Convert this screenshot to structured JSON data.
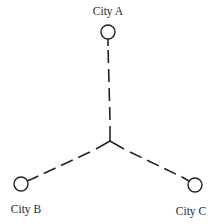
{
  "diagram": {
    "type": "network",
    "junction": {
      "x": 110,
      "y": 141
    },
    "cities": [
      {
        "id": "A",
        "label": "City A",
        "x": 108,
        "y": 32,
        "label_x": 108,
        "label_y": 14
      },
      {
        "id": "B",
        "label": "City B",
        "x": 21,
        "y": 184,
        "label_x": 26,
        "label_y": 212
      },
      {
        "id": "C",
        "label": "City C",
        "x": 195,
        "y": 185,
        "label_x": 191,
        "label_y": 214
      }
    ],
    "edges": [
      {
        "from": "junction",
        "to": "A",
        "style": "dashed"
      },
      {
        "from": "junction",
        "to": "B",
        "style": "dashed"
      },
      {
        "from": "junction",
        "to": "C",
        "style": "dashed"
      }
    ],
    "colors": {
      "line": "#222222",
      "background": "#ffffff",
      "text": "#2a2a2a"
    }
  }
}
